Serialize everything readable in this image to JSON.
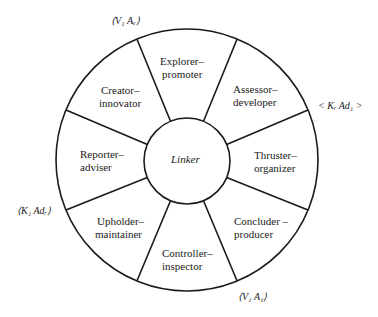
{
  "diagram": {
    "type": "wheel",
    "center": {
      "label": "Linker"
    },
    "segments": [
      {
        "line1": "Explorer–",
        "line2": "promoter"
      },
      {
        "line1": "Assessor–",
        "line2": "developer"
      },
      {
        "line1": "Thruster–",
        "line2": "organizer"
      },
      {
        "line1": "Concluder –",
        "line2": "producer"
      },
      {
        "line1": "Controller–",
        "line2": "inspector"
      },
      {
        "line1": "Upholder–",
        "line2": "maintainer"
      },
      {
        "line1": "Reporter–",
        "line2": "adviser"
      },
      {
        "line1": "Creator–",
        "line2": "innovator"
      }
    ],
    "annotations": [
      {
        "text": "⟨V₁ Aₑ⟩"
      },
      {
        "text": "< Kᵣ Ad₁ >"
      },
      {
        "text": "⟨V₁ A₁⟩"
      },
      {
        "text": "⟨K₁ Adᵣ⟩"
      }
    ],
    "colors": {
      "stroke": "#1a1a1a",
      "background": "#ffffff"
    }
  }
}
